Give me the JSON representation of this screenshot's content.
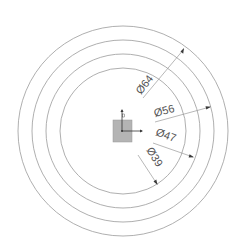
{
  "diagram": {
    "type": "concentric-circles-dimension-drawing",
    "center": {
      "x": 123,
      "y": 131
    },
    "colors": {
      "circle_stroke": "#9a9a9a",
      "dimension_text": "#555555",
      "origin_square": "#b4b4b4",
      "axis": "#333333"
    },
    "circles": [
      {
        "label": "Ø64",
        "radius_px": 105
      },
      {
        "label": "Ø56",
        "radius_px": 91
      },
      {
        "label": "Ø47",
        "radius_px": 77
      },
      {
        "label": "Ø39",
        "radius_px": 63
      }
    ],
    "dimensions": [
      {
        "label": "Ø64",
        "value": "64",
        "symbol": "Ø"
      },
      {
        "label": "Ø56",
        "value": "56",
        "symbol": "Ø"
      },
      {
        "label": "Ø47",
        "value": "47",
        "symbol": "Ø"
      },
      {
        "label": "Ø39",
        "value": "39",
        "symbol": "Ø"
      }
    ],
    "origin": {
      "x_axis_label": "X",
      "y_axis_label": "Y"
    }
  }
}
